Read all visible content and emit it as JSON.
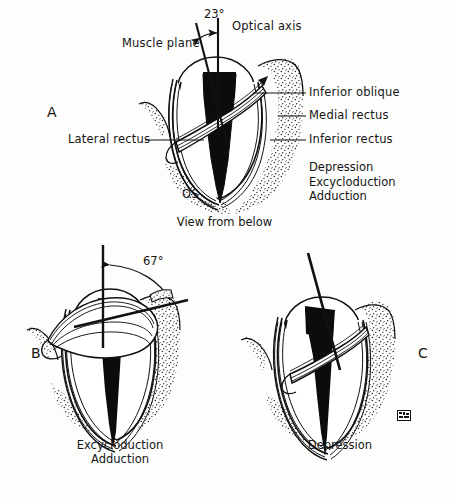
{
  "figure": {
    "background_color": "#fdfdfc",
    "ink_color": "#161616"
  },
  "panels": [
    {
      "id": "A",
      "letter": "A",
      "eye_label": "OS",
      "view_caption": "View from below",
      "angle": {
        "value": "23°",
        "between": [
          "Muscle plane",
          "Optical axis"
        ]
      },
      "axis_labels": [
        {
          "name": "muscle-plane",
          "text": "Muscle plane"
        },
        {
          "name": "optical-axis",
          "text": "Optical axis"
        }
      ],
      "structure_labels": [
        {
          "name": "inferior-oblique",
          "text": "Inferior oblique"
        },
        {
          "name": "medial-rectus",
          "text": "Medial rectus"
        },
        {
          "name": "inferior-rectus",
          "text": "Inferior rectus"
        },
        {
          "name": "lateral-rectus",
          "text": "Lateral rectus"
        }
      ],
      "actions": [
        "Depression",
        "Excycloduction",
        "Adduction"
      ]
    },
    {
      "id": "B",
      "letter": "B",
      "angle": {
        "value": "67°"
      },
      "actions": [
        "Excycloduction",
        "Adduction"
      ]
    },
    {
      "id": "C",
      "letter": "C",
      "actions": [
        "Depression"
      ],
      "signature": "artist-signature-mark"
    }
  ]
}
